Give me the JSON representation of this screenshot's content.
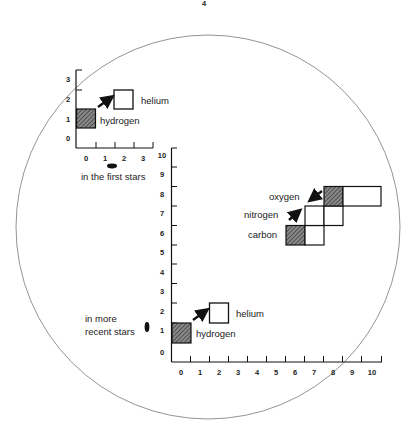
{
  "page_number": "4",
  "first_stars": {
    "caption": "in the first stars",
    "x_ticks": [
      "0",
      "1",
      "2",
      "3"
    ],
    "y_ticks": [
      "0",
      "1",
      "2",
      "3"
    ],
    "labels": {
      "hydrogen": "hydrogen",
      "helium": "helium"
    }
  },
  "recent_stars": {
    "caption_line1": "in more",
    "caption_line2": "recent stars",
    "x_ticks": [
      "0",
      "1",
      "2",
      "3",
      "4",
      "5",
      "6",
      "7",
      "8",
      "9",
      "10"
    ],
    "y_ticks": [
      "0",
      "1",
      "2",
      "3",
      "4",
      "5",
      "6",
      "7",
      "8",
      "9",
      "10"
    ],
    "labels": {
      "hydrogen": "hydrogen",
      "helium": "helium",
      "carbon": "carbon",
      "nitrogen": "nitrogen",
      "oxygen": "oxygen"
    }
  },
  "colors": {
    "line": "#1a1a1a",
    "hatch": "#555555",
    "circle": "#777777"
  }
}
